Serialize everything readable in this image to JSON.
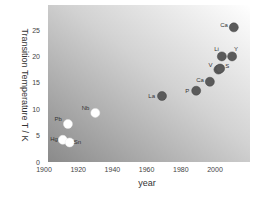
{
  "chart_data": {
    "type": "scatter",
    "title": "",
    "xlabel": "year",
    "ylabel": "Transition Temperature   T / K",
    "xlim": [
      1900,
      2020
    ],
    "ylim": [
      0,
      28
    ],
    "xticks": [
      1900,
      1920,
      1940,
      1960,
      1980,
      2000
    ],
    "yticks": [
      0,
      5,
      10,
      15,
      20,
      25
    ],
    "grid": false,
    "legend": null,
    "background": "gradient dark gray (bottom-left) to white (top-right)",
    "series": [
      {
        "name": "ambient-pressure elements",
        "marker": "open white circle",
        "color": "#ffffff",
        "points": [
          {
            "label": "Hg",
            "x": 1911,
            "y": 4.2
          },
          {
            "label": "Sn",
            "x": 1915,
            "y": 3.7
          },
          {
            "label": "Pb",
            "x": 1914,
            "y": 7.2
          },
          {
            "label": "Nb",
            "x": 1930,
            "y": 9.3
          }
        ]
      },
      {
        "name": "high-pressure elements",
        "marker": "filled dark circle",
        "color": "#555555",
        "points": [
          {
            "label": "La",
            "x": 1969,
            "y": 12.5
          },
          {
            "label": "P",
            "x": 1989,
            "y": 13.5
          },
          {
            "label": "Ca",
            "x": 1997,
            "y": 15.2
          },
          {
            "label": "V",
            "x": 2002,
            "y": 17.5
          },
          {
            "label": "S",
            "x": 2003,
            "y": 17.7
          },
          {
            "label": "Li",
            "x": 2004,
            "y": 20.0
          },
          {
            "label": "Y",
            "x": 2010,
            "y": 20.0
          },
          {
            "label": "Ca",
            "x": 2011,
            "y": 25.5
          }
        ]
      }
    ]
  }
}
